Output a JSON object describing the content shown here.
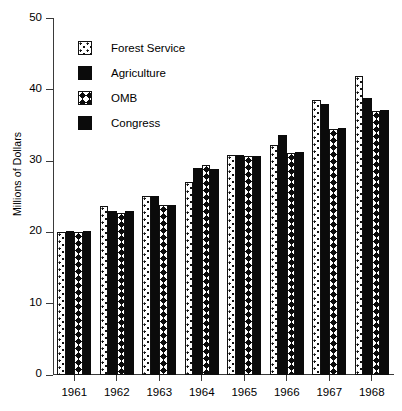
{
  "chart_data": {
    "type": "bar",
    "title": "",
    "subtitle": "",
    "xlabel": "",
    "ylabel": "Millions of Dollars",
    "categories": [
      "1961",
      "1962",
      "1963",
      "1964",
      "1965",
      "1966",
      "1967",
      "1968"
    ],
    "ylim": [
      0,
      50
    ],
    "yticks": [
      0,
      10,
      20,
      30,
      40,
      50
    ],
    "ytick_labels": [
      "0",
      "10",
      "20",
      "30",
      "40",
      "50"
    ],
    "grid": false,
    "legend_position": "upper-left-inside",
    "series": [
      {
        "name": "Forest Service",
        "pattern": "dotted",
        "color": "#ffffff",
        "outline": "#111111",
        "values": [
          20.0,
          23.7,
          25.0,
          27.0,
          30.8,
          32.2,
          38.5,
          41.8
        ]
      },
      {
        "name": "Agriculture",
        "pattern": "solid",
        "color": "#0b0b0b",
        "outline": "#0b0b0b",
        "values": [
          20.1,
          23.0,
          25.0,
          28.9,
          30.8,
          33.6,
          38.0,
          38.8
        ]
      },
      {
        "name": "OMB",
        "pattern": "chevron",
        "color": "#0b0b0b",
        "outline": "#111111",
        "values": [
          20.0,
          22.7,
          23.8,
          29.4,
          30.7,
          31.0,
          34.5,
          37.0
        ]
      },
      {
        "name": "Congress",
        "pattern": "solid",
        "color": "#0b0b0b",
        "outline": "#0b0b0b",
        "values": [
          20.1,
          23.0,
          23.8,
          28.8,
          30.7,
          31.2,
          34.6,
          37.1
        ]
      }
    ]
  }
}
